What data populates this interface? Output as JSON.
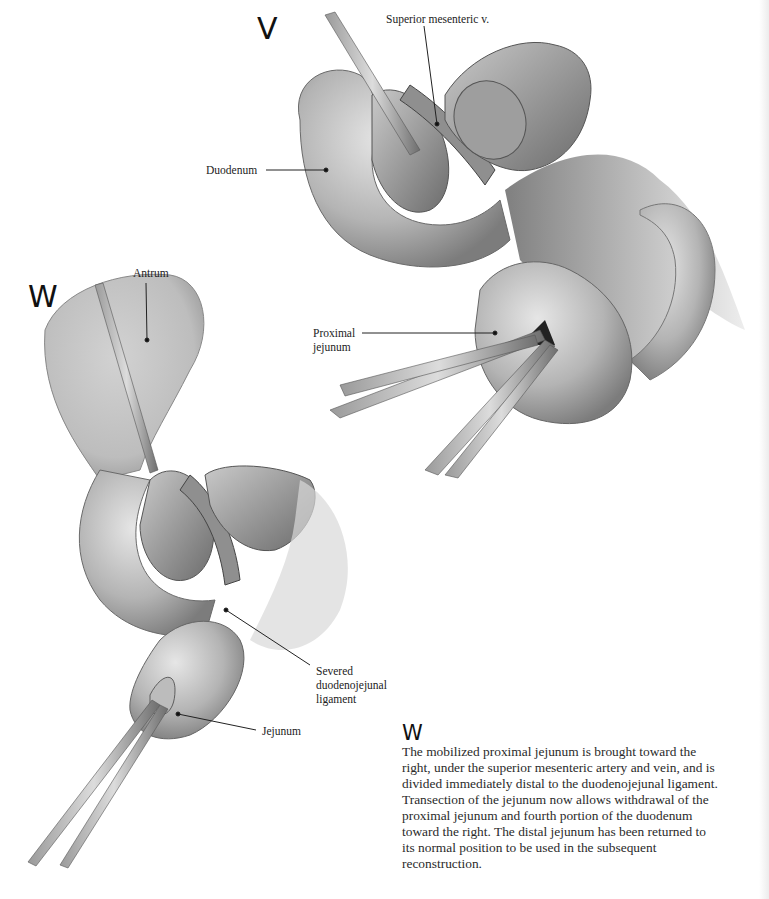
{
  "figure_v": {
    "panel_letter": "V",
    "labels": {
      "superior_mesenteric_v": "Superior mesenteric v.",
      "duodenum": "Duodenum",
      "proximal_jejunum": "Proximal\njejunum"
    }
  },
  "figure_w": {
    "panel_letter": "W",
    "labels": {
      "antrum": "Antrum",
      "severed_ligament": "Severed\nduodenojejunal\nligament",
      "jejunum": "Jejunum"
    }
  },
  "caption": {
    "letter": "W",
    "text": "The mobilized proximal jejunum is brought toward the\nright, under the superior mesenteric artery and vein, and is\ndivided immediately distal to the duodenojejunal ligament.\nTransection of the jejunum now allows withdrawal of the\nproximal jejunum and fourth portion of the duodenum\ntoward the right. The distal jejunum has been returned to\nits normal position to be used in the subsequent\nreconstruction."
  },
  "colors": {
    "tissue_light": "#d6d6d6",
    "tissue_mid": "#9a9a9a",
    "tissue_dark": "#4a4a4a",
    "text": "#1a1a1a"
  }
}
